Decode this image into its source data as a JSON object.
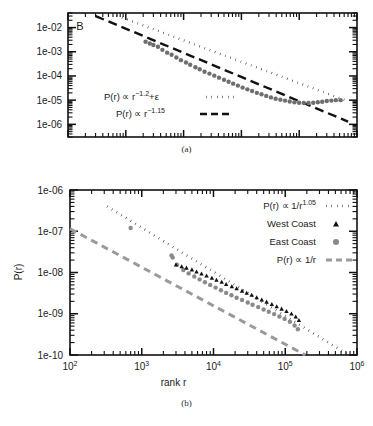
{
  "figure": {
    "panel_a_caption": "(a)",
    "panel_b_caption": "(b)",
    "panel_a_letter": "B"
  },
  "panel_a": {
    "y_ticks": [
      "1e-02",
      "1e-03",
      "1e-04",
      "1e-05",
      "1e-06"
    ],
    "legend": [
      {
        "text": "P(r) ∝ r",
        "exp": "−1.2",
        "suffix": "+ε",
        "style": "dotted",
        "color": "#111111"
      },
      {
        "text": "P(r) ∝ r",
        "exp": "−1.15",
        "suffix": "",
        "style": "dashed",
        "color": "#111111"
      }
    ]
  },
  "panel_b": {
    "y_axis_title": "P(r)",
    "x_axis_title": "rank r",
    "y_ticks": [
      "1e-06",
      "1e-07",
      "1e-08",
      "1e-09",
      "1e-10"
    ],
    "x_ticks": [
      "10",
      "10",
      "10",
      "10",
      "10"
    ],
    "x_tick_exps": [
      "2",
      "3",
      "4",
      "5",
      "6"
    ],
    "legend": [
      {
        "label": "P(r) ∝ 1/r",
        "exp": "1.05",
        "marker": "dotted-line",
        "color": "#111111"
      },
      {
        "label": "West Coast",
        "exp": "",
        "marker": "triangle",
        "color": "#111111"
      },
      {
        "label": "East Coast",
        "exp": "",
        "marker": "circle",
        "color": "#8a8a8a"
      },
      {
        "label": "P(r) ∝ 1/r",
        "exp": "",
        "marker": "dashed-line",
        "color": "#9a9a9a"
      }
    ]
  },
  "chart_data": [
    {
      "type": "scatter",
      "id": "panel-a",
      "title": "B",
      "xlabel": "",
      "ylabel": "",
      "xscale": "log",
      "yscale": "log",
      "xlim": [
        100,
        10000000
      ],
      "ylim": [
        3e-07,
        0.04
      ],
      "ytick_values": [
        0.01,
        0.001,
        0.0001,
        1e-05,
        1e-06
      ],
      "grid": false,
      "legend_position": "center-left",
      "series": [
        {
          "name": "data",
          "marker": "circle",
          "color": "#6e6e6e",
          "points": [
            [
              2200,
              0.0026
            ],
            [
              2600,
              0.0022
            ],
            [
              3000,
              0.0019
            ],
            [
              3600,
              0.0016
            ],
            [
              4300,
              0.0012
            ],
            [
              5200,
              0.00092
            ],
            [
              6200,
              0.00075
            ],
            [
              7500,
              0.00058
            ],
            [
              9000,
              0.00045
            ],
            [
              11000,
              0.00036
            ],
            [
              13000,
              0.00029
            ],
            [
              16000,
              0.00023
            ],
            [
              19000,
              0.00019
            ],
            [
              23000,
              0.00015
            ],
            [
              28000,
              0.000125
            ],
            [
              34000,
              0.000103
            ],
            [
              41000,
              8.5e-05
            ],
            [
              50000,
              7e-05
            ],
            [
              60000,
              5.8e-05
            ],
            [
              72000,
              4.8e-05
            ],
            [
              87000,
              4e-05
            ],
            [
              105000,
              3.3e-05
            ],
            [
              127000,
              2.8e-05
            ],
            [
              153000,
              2.4e-05
            ],
            [
              185000,
              2e-05
            ],
            [
              223000,
              1.75e-05
            ],
            [
              269000,
              1.5e-05
            ],
            [
              324000,
              1.3e-05
            ],
            [
              391000,
              1.15e-05
            ],
            [
              472000,
              1.05e-05
            ],
            [
              569000,
              9.6e-06
            ],
            [
              686000,
              8.8e-06
            ],
            [
              827000,
              8.2e-06
            ],
            [
              997000,
              7.8e-06
            ],
            [
              1200000,
              7.6e-06
            ],
            [
              1450000,
              7.6e-06
            ],
            [
              1750000,
              7.8e-06
            ],
            [
              2100000,
              8.2e-06
            ],
            [
              2500000,
              8.6e-06
            ],
            [
              3000000,
              9.2e-06
            ],
            [
              3600000,
              9.6e-06
            ],
            [
              4300000,
              1e-05
            ],
            [
              5200000,
              1e-05
            ]
          ]
        },
        {
          "name": "P(r) ∝ r^-1.2+ε",
          "style": "dotted",
          "color": "#111111",
          "line": [
            [
              700,
              0.031
            ],
            [
              7000000,
              9e-06
            ]
          ]
        },
        {
          "name": "P(r) ∝ r^-1.15",
          "style": "dashed",
          "color": "#111111",
          "line": [
            [
              300,
              0.03
            ],
            [
              7000000,
              1.3e-06
            ]
          ]
        }
      ]
    },
    {
      "type": "scatter",
      "id": "panel-b",
      "title": "",
      "xlabel": "rank r",
      "ylabel": "P(r)",
      "xscale": "log",
      "yscale": "log",
      "xlim": [
        100,
        1000000
      ],
      "ylim": [
        1e-10,
        1e-06
      ],
      "xtick_values": [
        100,
        1000,
        10000,
        100000,
        1000000
      ],
      "ytick_values": [
        1e-06,
        1e-07,
        1e-08,
        1e-09,
        1e-10
      ],
      "grid": false,
      "legend_position": "upper-right",
      "series": [
        {
          "name": "West Coast",
          "marker": "triangle",
          "color": "#111111",
          "points": [
            [
              3000,
              1.55e-08
            ],
            [
              3600,
              1.4e-08
            ],
            [
              4200,
              1.3e-08
            ],
            [
              5000,
              1.18e-08
            ],
            [
              5800,
              1.05e-08
            ],
            [
              6800,
              9.4e-09
            ],
            [
              8000,
              8.4e-09
            ],
            [
              9500,
              7.4e-09
            ],
            [
              11000,
              6.6e-09
            ],
            [
              13000,
              5.9e-09
            ],
            [
              15000,
              5.2e-09
            ],
            [
              18000,
              4.6e-09
            ],
            [
              21000,
              4.1e-09
            ],
            [
              25000,
              3.6e-09
            ],
            [
              29000,
              3.2e-09
            ],
            [
              34000,
              2.85e-09
            ],
            [
              40000,
              2.5e-09
            ],
            [
              47000,
              2.2e-09
            ],
            [
              55000,
              1.95e-09
            ],
            [
              65000,
              1.7e-09
            ],
            [
              76000,
              1.5e-09
            ],
            [
              89000,
              1.32e-09
            ],
            [
              104000,
              1.15e-09
            ],
            [
              122000,
              1e-09
            ],
            [
              140000,
              8.5e-10
            ],
            [
              155000,
              7e-10
            ]
          ]
        },
        {
          "name": "East Coast",
          "marker": "circle",
          "color": "#8a8a8a",
          "points": [
            [
              700,
              1.2e-07
            ],
            [
              2600,
              2.6e-08
            ],
            [
              2700,
              2.3e-08
            ],
            [
              3100,
              1.55e-08
            ],
            [
              3800,
              1.15e-08
            ],
            [
              4500,
              9.5e-09
            ],
            [
              5400,
              8e-09
            ],
            [
              6400,
              6.8e-09
            ],
            [
              7600,
              5.8e-09
            ],
            [
              9000,
              5e-09
            ],
            [
              10700,
              4.3e-09
            ],
            [
              12700,
              3.7e-09
            ],
            [
              15000,
              3.2e-09
            ],
            [
              17800,
              2.8e-09
            ],
            [
              21000,
              2.45e-09
            ],
            [
              25000,
              2.15e-09
            ],
            [
              30000,
              1.88e-09
            ],
            [
              35000,
              1.65e-09
            ],
            [
              42000,
              1.45e-09
            ],
            [
              50000,
              1.27e-09
            ],
            [
              59000,
              1.12e-09
            ],
            [
              70000,
              9.8e-10
            ],
            [
              83000,
              8.6e-10
            ],
            [
              98000,
              7.5e-10
            ],
            [
              116000,
              6.4e-10
            ],
            [
              135000,
              5.2e-10
            ],
            [
              150000,
              4.2e-10
            ]
          ]
        },
        {
          "name": "P(r) ∝ 1/r^1.05",
          "style": "dotted",
          "color": "#111111",
          "line": [
            [
              330,
              4e-07
            ],
            [
              1000000,
              7.5e-11
            ]
          ]
        },
        {
          "name": "P(r) ∝ 1/r",
          "style": "dashed",
          "color": "#9a9a9a",
          "line": [
            [
              100,
              1.15e-07
            ],
            [
              190000,
              1e-10
            ]
          ]
        }
      ]
    }
  ]
}
